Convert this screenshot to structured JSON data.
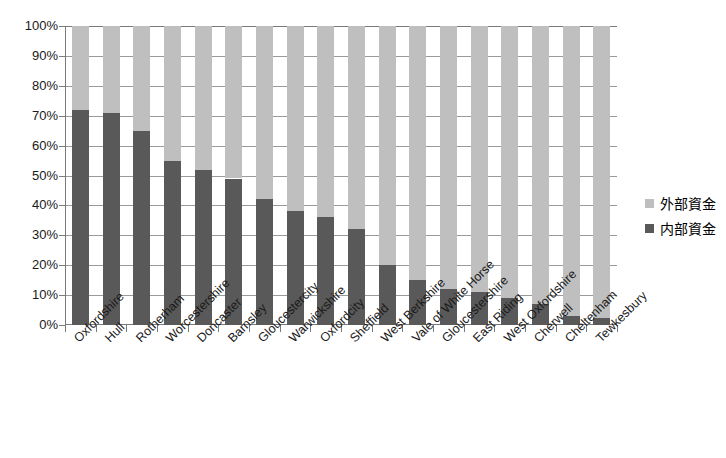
{
  "chart_data": {
    "type": "bar",
    "stacked": true,
    "title": "",
    "xlabel": "",
    "ylabel": "",
    "ylim": [
      0,
      100
    ],
    "ytick_labels": [
      "100%",
      "90%",
      "80%",
      "70%",
      "60%",
      "50%",
      "40%",
      "30%",
      "20%",
      "10%",
      "0%"
    ],
    "ytick_values": [
      100,
      90,
      80,
      70,
      60,
      50,
      40,
      30,
      20,
      10,
      0
    ],
    "grid": true,
    "legend_position": "right",
    "categories": [
      "Oxfordshire",
      "Hull",
      "Rotherham",
      "Worcestershire",
      "Doncaster",
      "Barnsley",
      "Gloucestercity",
      "Warwickshire",
      "Oxfordcity",
      "Sheffield",
      "West Berkshire",
      "Vale of White Horse",
      "Gloucestershire",
      "East Riding",
      "West Oxfordshire",
      "Cherwell",
      "Cheltenham",
      "Tewkesbury"
    ],
    "series": [
      {
        "name": "内部資金",
        "color": "#595959",
        "values": [
          72,
          71,
          65,
          55,
          52,
          49,
          42,
          38,
          36,
          32,
          20,
          15,
          12,
          11,
          9,
          7,
          3,
          2.5
        ]
      },
      {
        "name": "外部資金",
        "color": "#bfbfbf",
        "values": [
          28,
          29,
          35,
          45,
          48,
          51,
          58,
          62,
          64,
          68,
          80,
          85,
          88,
          89,
          91,
          93,
          97,
          97.5
        ]
      }
    ]
  },
  "legend": {
    "items": [
      {
        "label": "外部資金",
        "swatch": "legend-swatch-outer"
      },
      {
        "label": "内部資金",
        "swatch": "legend-swatch-inner"
      }
    ]
  },
  "colors": {
    "outer_funds": "#bfbfbf",
    "inner_funds": "#595959",
    "axis": "#7a7a7a",
    "gridline": "#9a9a9a",
    "background": "#ffffff"
  }
}
